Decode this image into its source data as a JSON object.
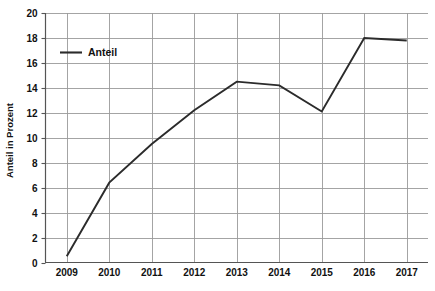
{
  "chart_data": {
    "type": "line",
    "title": "",
    "xlabel": "",
    "ylabel": "Anteil in Prozent",
    "categories": [
      "2009",
      "2010",
      "2011",
      "2012",
      "2013",
      "2014",
      "2015",
      "2016",
      "2017"
    ],
    "series": [
      {
        "name": "Anteil",
        "values": [
          0.5,
          6.4,
          9.5,
          12.2,
          14.5,
          14.2,
          12.1,
          18.0,
          17.8
        ],
        "color": "#2b2b2b"
      }
    ],
    "ylim": [
      0,
      20
    ],
    "ytick_labels": [
      "0",
      "2",
      "4",
      "6",
      "8",
      "10",
      "12",
      "14",
      "16",
      "18",
      "20"
    ],
    "ytick_values": [
      0,
      2,
      4,
      6,
      8,
      10,
      12,
      14,
      16,
      18,
      20
    ],
    "grid": "both",
    "grid_color": "#9a9a9a",
    "legend_position": "top-left",
    "legend_entries": [
      "Anteil"
    ],
    "background_color": "#ffffff",
    "axis_color": "#555555"
  },
  "legend": {
    "anteil_label": "Anteil"
  },
  "axes": {
    "y_title": "Anteil in Prozent"
  },
  "caption": {
    "text": ""
  }
}
